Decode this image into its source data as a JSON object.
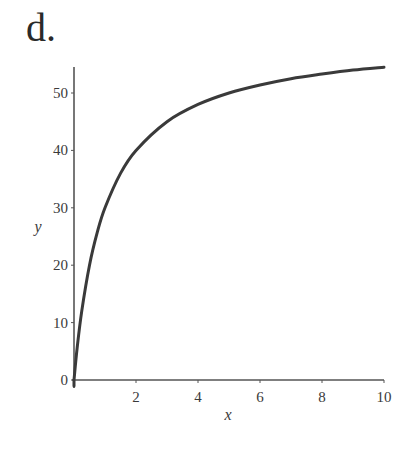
{
  "panel": {
    "label": "d."
  },
  "chart_data": {
    "type": "line",
    "title": "",
    "panel_label": "d.",
    "xlabel": "x",
    "ylabel": "y",
    "xlim": [
      0,
      10
    ],
    "ylim": [
      0,
      55
    ],
    "x_ticks": [
      2,
      4,
      6,
      8,
      10
    ],
    "y_ticks": [
      0,
      10,
      20,
      30,
      40,
      50
    ],
    "grid": false,
    "legend": null,
    "line_color": "#3a3a3a",
    "series": [
      {
        "name": "y",
        "x": [
          0,
          0.1,
          0.25,
          0.5,
          0.75,
          1,
          1.5,
          2,
          3,
          4,
          5,
          6,
          7,
          8,
          9,
          10
        ],
        "values": [
          0,
          5.5,
          12,
          20,
          25.7,
          30,
          36,
          40,
          45,
          48,
          50,
          51.4,
          52.5,
          53.3,
          54,
          54.5
        ]
      }
    ]
  }
}
